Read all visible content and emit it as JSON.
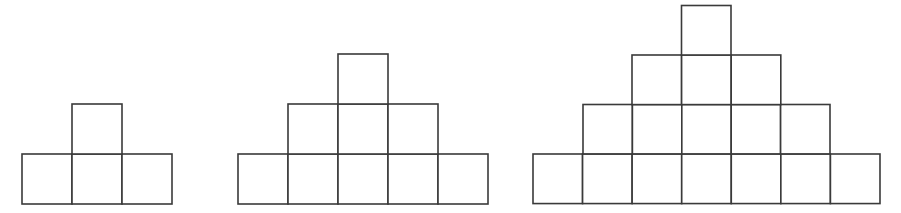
{
  "canvas": {
    "width": 901,
    "height": 213,
    "background_color": "#ffffff"
  },
  "style": {
    "stroke_color": "#3a3a3a",
    "fill_color": "#ffffff",
    "stroke_width": 1.6,
    "cell_size": 50
  },
  "figure_sequence": {
    "name": "staircase-square-pyramid-sequence",
    "description": "Three figures of a growing pattern built from unit squares arranged in centered bottom-aligned rows forming stepped pyramids.",
    "figure_count": 3,
    "figures": [
      {
        "index": 1,
        "name": "figure-1",
        "tier_count": 2,
        "row_counts": [
          3,
          1
        ],
        "total_squares": 4,
        "base_width": 3,
        "bounds": {
          "x": 22,
          "y": 104,
          "width": 150,
          "height": 100
        },
        "tiers": [
          {
            "name": "tier-bottom",
            "row_from_bottom": 1,
            "squares": 3,
            "x": 22,
            "y": 154,
            "cell": 50
          },
          {
            "name": "tier-top",
            "row_from_bottom": 2,
            "squares": 1,
            "x": 72,
            "y": 104,
            "cell": 50
          }
        ]
      },
      {
        "index": 2,
        "name": "figure-2",
        "tier_count": 3,
        "row_counts": [
          5,
          3,
          1
        ],
        "total_squares": 9,
        "base_width": 5,
        "bounds": {
          "x": 238,
          "y": 54,
          "width": 250,
          "height": 150
        },
        "tiers": [
          {
            "name": "tier-bottom",
            "row_from_bottom": 1,
            "squares": 5,
            "x": 238,
            "y": 154,
            "cell": 50
          },
          {
            "name": "tier-middle",
            "row_from_bottom": 2,
            "squares": 3,
            "x": 288,
            "y": 104,
            "cell": 50
          },
          {
            "name": "tier-top",
            "row_from_bottom": 3,
            "squares": 1,
            "x": 338,
            "y": 54,
            "cell": 50
          }
        ]
      },
      {
        "index": 3,
        "name": "figure-3",
        "tier_count": 4,
        "row_counts": [
          7,
          5,
          3,
          1
        ],
        "total_squares": 16,
        "base_width": 7,
        "bounds": {
          "x": 533,
          "y": 5,
          "width": 347,
          "height": 199
        },
        "tiers": [
          {
            "name": "tier-bottom",
            "row_from_bottom": 1,
            "squares": 7,
            "x": 533,
            "y": 154,
            "cell": 49.57
          },
          {
            "name": "tier-second",
            "row_from_bottom": 2,
            "squares": 5,
            "x": 583,
            "y": 104.5,
            "cell": 49.4
          },
          {
            "name": "tier-third",
            "row_from_bottom": 3,
            "squares": 3,
            "x": 632,
            "y": 55,
            "cell": 49.6
          },
          {
            "name": "tier-top",
            "row_from_bottom": 4,
            "squares": 1,
            "x": 681.5,
            "y": 5.5,
            "cell": 49.5
          }
        ]
      }
    ]
  }
}
